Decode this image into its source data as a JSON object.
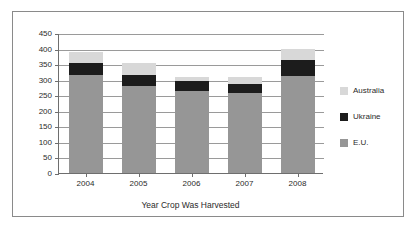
{
  "chart_data": {
    "type": "bar",
    "stacked": true,
    "title": "",
    "subtitle": "",
    "xlabel": "Year Crop Was Harvested",
    "ylabel": "",
    "categories": [
      "2004",
      "2005",
      "2006",
      "2007",
      "2008"
    ],
    "series": [
      {
        "name": "E.U.",
        "color": "#969696",
        "values": [
          316,
          280,
          265,
          257,
          312
        ]
      },
      {
        "name": "Ukraine",
        "color": "#1c1c1c",
        "values": [
          37,
          35,
          30,
          28,
          50
        ]
      },
      {
        "name": "Australia",
        "color": "#d8d8d8",
        "values": [
          35,
          38,
          15,
          22,
          35
        ]
      }
    ],
    "stack_tops": {
      "E.U.": [
        316,
        280,
        265,
        257,
        312
      ],
      "Ukraine": [
        353,
        315,
        295,
        285,
        362
      ],
      "Australia": [
        388,
        353,
        310,
        307,
        397
      ]
    },
    "ylim": [
      0,
      450
    ],
    "ytick_values": [
      0,
      50,
      100,
      150,
      200,
      250,
      300,
      350,
      400,
      450
    ],
    "ytick_labels": [
      "0",
      "50",
      "100",
      "150",
      "200",
      "250",
      "300",
      "350",
      "400",
      "450"
    ],
    "grid": true,
    "legend_position": "right",
    "legend_order": [
      "Australia",
      "Ukraine",
      "E.U."
    ]
  },
  "legend": {
    "entries": [
      {
        "label": "Australia",
        "color": "#d8d8d8"
      },
      {
        "label": "Ukraine",
        "color": "#1c1c1c"
      },
      {
        "label": "E.U.",
        "color": "#969696"
      }
    ]
  },
  "axes": {
    "x_axis_title": "Year Crop Was Harvested"
  }
}
